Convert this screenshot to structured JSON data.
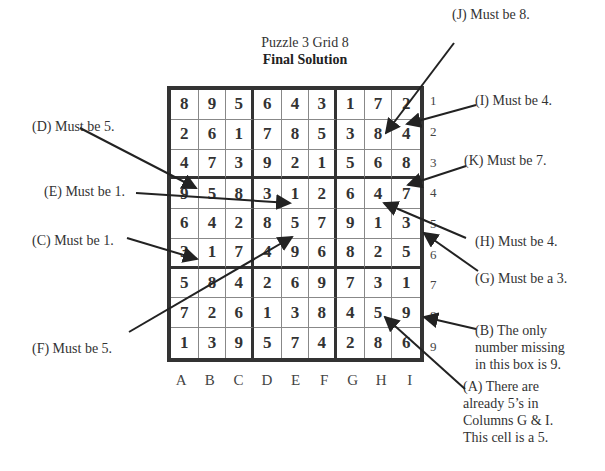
{
  "title": {
    "line1": "Puzzle 3  Grid 8",
    "line2": "Final Solution"
  },
  "grid": {
    "rows": [
      [
        "8",
        "9",
        "5",
        "6",
        "4",
        "3",
        "1",
        "7",
        "2"
      ],
      [
        "2",
        "6",
        "1",
        "7",
        "8",
        "5",
        "3",
        "8",
        "4"
      ],
      [
        "4",
        "7",
        "3",
        "9",
        "2",
        "1",
        "5",
        "6",
        "8"
      ],
      [
        "9",
        "5",
        "8",
        "3",
        "1",
        "2",
        "6",
        "4",
        "7"
      ],
      [
        "6",
        "4",
        "2",
        "8",
        "5",
        "7",
        "9",
        "1",
        "3"
      ],
      [
        "3",
        "1",
        "7",
        "4",
        "9",
        "6",
        "8",
        "2",
        "5"
      ],
      [
        "5",
        "8",
        "4",
        "2",
        "6",
        "9",
        "7",
        "3",
        "1"
      ],
      [
        "7",
        "2",
        "6",
        "1",
        "3",
        "8",
        "4",
        "5",
        "9"
      ],
      [
        "1",
        "3",
        "9",
        "5",
        "7",
        "4",
        "2",
        "8",
        "6"
      ]
    ],
    "column_labels": [
      "A",
      "B",
      "C",
      "D",
      "E",
      "F",
      "G",
      "H",
      "I"
    ],
    "row_labels": [
      "1",
      "2",
      "3",
      "4",
      "5",
      "6",
      "7",
      "8",
      "9"
    ]
  },
  "annotations": {
    "J": "(J) Must be 8.",
    "I": "(I) Must be 4.",
    "D": "(D) Must be 5.",
    "K": "(K) Must be 7.",
    "E": "(E) Must be 1.",
    "H": "(H) Must be 4.",
    "C": "(C) Must be 1.",
    "G": "(G) Must be a 3.",
    "F": "(F) Must be 5.",
    "B_lines": [
      "(B) The only",
      "number missing",
      "in this box is 9."
    ],
    "A_lines": [
      "(A) There are",
      "already 5’s in",
      "Columns G & I.",
      "This cell is a 5."
    ]
  }
}
